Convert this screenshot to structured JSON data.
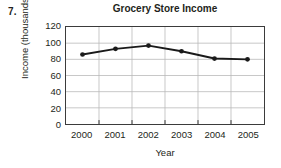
{
  "problem": {
    "number": "7."
  },
  "chart_data": {
    "type": "line",
    "title": "Grocery Store Income",
    "xlabel": "Year",
    "ylabel": "Income (thousands)",
    "categories": [
      "2000",
      "2001",
      "2002",
      "2003",
      "2004",
      "2005"
    ],
    "values": [
      86,
      93,
      97,
      90,
      81,
      80
    ],
    "series": [
      {
        "name": "Grocery Store Income",
        "values": [
          86,
          93,
          97,
          90,
          81,
          80
        ]
      }
    ],
    "ylim": [
      0,
      120
    ],
    "ytick_labels": [
      "0",
      "20",
      "40",
      "60",
      "80",
      "100",
      "120"
    ],
    "ytick_values": [
      0,
      20,
      40,
      60,
      80,
      100,
      120
    ],
    "xtick_labels": [
      "2000",
      "2001",
      "2002",
      "2003",
      "2004",
      "2005"
    ],
    "grid": true,
    "legend": "none",
    "line_color": "#1a1a1a",
    "marker": "filled-circle",
    "grid_color": "#b9b9b9",
    "axis_color": "#3b3b3b",
    "background": "#ffffff"
  }
}
